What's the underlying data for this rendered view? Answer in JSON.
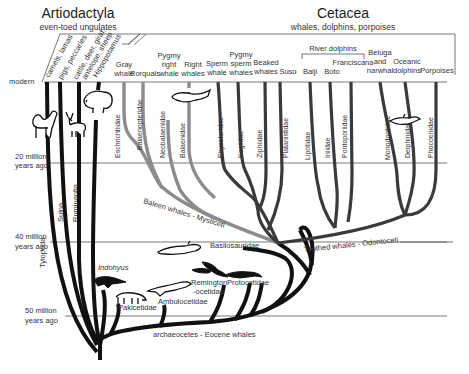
{
  "groups": {
    "artiodactyla": {
      "title": "Artiodactyla",
      "subtitle": "even-toed ungulates"
    },
    "cetacea": {
      "title": "Cetacea",
      "subtitle": "whales, dolphins, porpoises"
    },
    "river_dolphins": "River dolphins"
  },
  "time_axis": {
    "modern": "modern",
    "m20_a": "20 million",
    "m20_b": "years ago",
    "m40_a": "40 million",
    "m40_b": "years ago",
    "m50_a": "50 million",
    "m50_b": "years ago"
  },
  "artiodactyl_taxa": [
    "camels, lamas",
    "pigs, peccaries",
    "cattle, deer, giraf,",
    "antelope, sheep",
    "Hippopotamus"
  ],
  "artiodactyl_clades": [
    "Tylopoda",
    "Suina",
    "Ruminantia"
  ],
  "whale_common_names": {
    "gray_a": "Gray",
    "gray_b": "whale",
    "rorquals": "Rorquals",
    "pygmy_right_a": "Pygmy",
    "pygmy_right_b": "right",
    "pygmy_right_c": "whale",
    "right_a": "Right",
    "right_b": "whales",
    "sperm_a": "Sperm",
    "sperm_b": "whale",
    "pygmy_sperm_a": "Pygmy",
    "pygmy_sperm_b": "sperm",
    "pygmy_sperm_c": "whales",
    "beaked_a": "Beaked",
    "beaked_b": "whales",
    "susu": "Susu",
    "baiji": "Baiji",
    "boto": "Boto",
    "franciscana": "Franciscana",
    "beluga_a": "Beluga",
    "beluga_b": "and",
    "beluga_c": "narwhal",
    "oceanic_a": "Oceanic",
    "oceanic_b": "dolphins",
    "porpoises": "Porpoises"
  },
  "families": {
    "eschrichtiidae": "Eschrichtiidae",
    "balaenopteridae": "Balaenopteridae",
    "neobalaenidae": "Neobalaenidae",
    "balaenidae": "Balaenidae",
    "physeteridae": "Physeteridae",
    "kogiidae": "Kogiidae",
    "ziphiidae": "Ziphiidae",
    "platanistidae": "Platanistidae",
    "lipotidae": "Lipotidae",
    "iniidae": "Iniidae",
    "pontoporiidae": "Pontoporiidae",
    "monodontidae": "Monodontidae",
    "delphinidae": "Delphinidae",
    "phocoenidae": "Phocoenidae"
  },
  "clade_labels": {
    "mysticeti": "Baleen whales - Mysticeti",
    "odontoceti": "Toothed whales - Odontoceti",
    "archaeocetes": "archaeocetes - Eocene whales"
  },
  "fossil_taxa": {
    "indohyus": "Indohyus",
    "pakicetidae": "Pakicetidae",
    "ambulocetidae": "Ambulocetidae",
    "remington_a": "Remington",
    "remington_b": "-ocetidae",
    "protocetidae": "Protocetidae",
    "basilosauridae": "Basilosauridae"
  },
  "colors": {
    "artiodactyl_branch": "#111111",
    "mysticete_branch": "#8c8c8c",
    "odontocete_branch": "#3a3a3a",
    "time_line": "#555555"
  }
}
